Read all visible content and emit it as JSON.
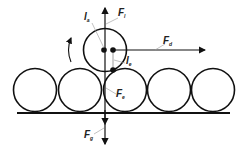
{
  "diagram": {
    "labels": {
      "lever_arm_a": {
        "main": "l",
        "sub": "a"
      },
      "lift_force": {
        "main": "F",
        "sub": "l"
      },
      "drag_force": {
        "main": "F",
        "sub": "d"
      },
      "lever_arm_e": {
        "main": "l",
        "sub": "e"
      },
      "contact_force": {
        "main": "F",
        "sub": "e"
      },
      "gravity_force": {
        "main": "F",
        "sub": "g"
      }
    },
    "bed_particle_count": 5,
    "colors": {
      "stroke": "#111111",
      "leader": "#888888",
      "background": "#ffffff"
    }
  }
}
